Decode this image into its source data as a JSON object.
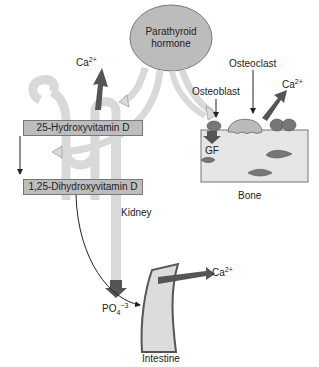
{
  "nodes": {
    "pth": {
      "line1": "Parathyroid",
      "line2": "hormone"
    },
    "vitd25": "25-Hydroxyvitamin D",
    "vitd125": "1,25-Dihydroxyvitamin D",
    "kidney": "Kidney",
    "bone": "Bone",
    "intestine": "Intestine",
    "osteoblast": "Osteoblast",
    "osteoclast": "Osteoclast",
    "gf": "GF"
  },
  "ions": {
    "ca_kidney": {
      "base": "Ca",
      "sup": "2+"
    },
    "ca_bone": {
      "base": "Ca",
      "sup": "2+"
    },
    "ca_intestine": {
      "base": "Ca",
      "sup": "2+"
    },
    "phosphate": {
      "base": "PO",
      "sub": "4",
      "sup": "−3"
    }
  },
  "colors": {
    "ellipse_fill": "#bcbcbc",
    "box_fill": "#bdbdbd",
    "arrow_light": "#d9d9d9",
    "arrow_dark": "#555555",
    "bone_fill": "#e6e6e6",
    "outline": "#666666"
  }
}
